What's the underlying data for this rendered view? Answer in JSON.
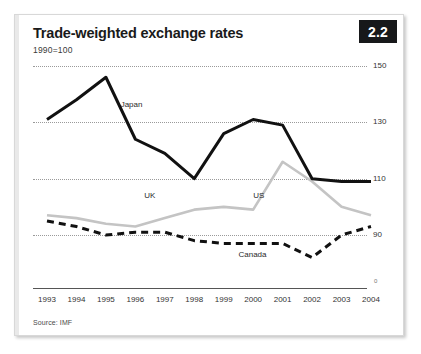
{
  "figure": {
    "badge": "2.2",
    "title": "Trade-weighted exchange rates",
    "subtitle": "1990=100",
    "source": "Source: IMF"
  },
  "chart_data": {
    "type": "line",
    "title": "Trade-weighted exchange rates",
    "subtitle": "1990=100",
    "xlabel": "",
    "ylabel": "",
    "ylim": [
      75,
      155
    ],
    "yticks": [
      90,
      110,
      130,
      150
    ],
    "grid": true,
    "legend_position": "inline-labels",
    "source": "Source: IMF",
    "categories": [
      "1993",
      "1994",
      "1995",
      "1996",
      "1997",
      "1998",
      "1999",
      "2000",
      "2001",
      "2002",
      "2003",
      "2004"
    ],
    "series": [
      {
        "name": "Japan",
        "style": "solid-black",
        "color": "#111111",
        "values": [
          131,
          138,
          146,
          124,
          119,
          110,
          126,
          131,
          129,
          110,
          109,
          109
        ]
      },
      {
        "name": "US",
        "style": "solid-grey",
        "color": "#c4c4c4",
        "values": [
          97,
          96,
          94,
          93,
          96,
          99,
          100,
          99,
          116,
          109,
          100,
          97
        ]
      },
      {
        "name": "Canada",
        "style": "dashed-black",
        "color": "#111111",
        "values": [
          95,
          93,
          90,
          91,
          91,
          88,
          87,
          87,
          87,
          82,
          90,
          93
        ]
      }
    ],
    "annotations": [
      {
        "text": "Japan",
        "x": 1995.5,
        "y": 136
      },
      {
        "text": "UK",
        "x": 1996.3,
        "y": 104
      },
      {
        "text": "US",
        "x": 2000.0,
        "y": 104
      },
      {
        "text": "Canada",
        "x": 1999.5,
        "y": 83
      }
    ]
  }
}
